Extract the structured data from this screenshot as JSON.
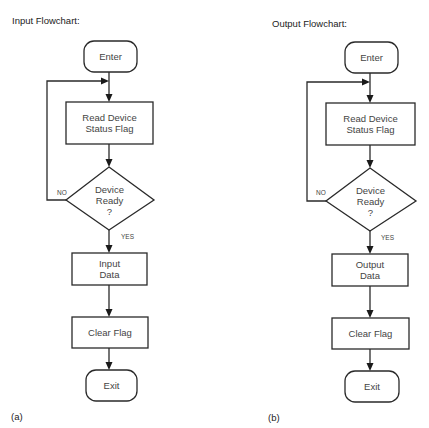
{
  "flowcharts": [
    {
      "title": "Input Flowchart:",
      "caption": "(a)",
      "nodes": {
        "start": "Enter",
        "read_line1": "Read Device",
        "read_line2": "Status Flag",
        "decision_line1": "Device",
        "decision_line2": "Ready",
        "decision_line3": "?",
        "data_line1": "Input",
        "data_line2": "Data",
        "clear": "Clear Flag",
        "end": "Exit"
      },
      "branches": {
        "no": "NO",
        "yes": "YES"
      }
    },
    {
      "title": "Output Flowchart:",
      "caption": "(b)",
      "nodes": {
        "start": "Enter",
        "read_line1": "Read Device",
        "read_line2": "Status Flag",
        "decision_line1": "Device",
        "decision_line2": "Ready",
        "decision_line3": "?",
        "data_line1": "Output",
        "data_line2": "Data",
        "clear": "Clear Flag",
        "end": "Exit"
      },
      "branches": {
        "no": "NO",
        "yes": "YES"
      }
    }
  ]
}
